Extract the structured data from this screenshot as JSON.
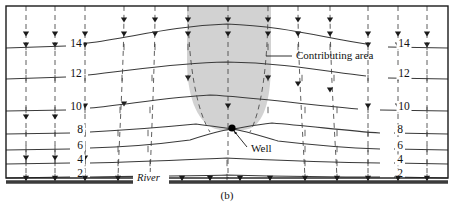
{
  "figure": {
    "caption": "(b)",
    "frame_color": "#1a1a1a",
    "background_color": "#ffffff"
  },
  "annotations": {
    "contributing_area": {
      "label": "Contributing area",
      "fill_color": "#d2d2d2",
      "x": 296,
      "y": 59
    },
    "well": {
      "label": "Well",
      "marker_color": "#000000",
      "x": 251,
      "y": 152,
      "marker_x": 232,
      "marker_y": 128
    },
    "river": {
      "label": "River",
      "x": 137,
      "y": 180
    }
  },
  "chart_data": {
    "type": "contour-map",
    "title": "(b)",
    "contour_variable": "hydraulic head",
    "contour_interval": 2,
    "contour_levels": [
      14,
      12,
      10,
      8,
      6,
      4,
      2
    ],
    "left_labels": [
      {
        "value": "14",
        "x": 76,
        "y": 47
      },
      {
        "value": "12",
        "x": 76,
        "y": 77
      },
      {
        "value": "10",
        "x": 76,
        "y": 110
      },
      {
        "value": "8",
        "x": 80,
        "y": 133
      },
      {
        "value": "6",
        "x": 80,
        "y": 149
      },
      {
        "value": "4",
        "x": 80,
        "y": 163
      },
      {
        "value": "2",
        "x": 80,
        "y": 177
      }
    ],
    "right_labels": [
      {
        "value": "14",
        "x": 404,
        "y": 47
      },
      {
        "value": "12",
        "x": 404,
        "y": 77
      },
      {
        "value": "10",
        "x": 404,
        "y": 110
      },
      {
        "value": "8",
        "x": 400,
        "y": 133
      },
      {
        "value": "6",
        "x": 400,
        "y": 149
      },
      {
        "value": "4",
        "x": 400,
        "y": 163
      },
      {
        "value": "2",
        "x": 400,
        "y": 177
      }
    ],
    "contour_paths": [
      {
        "level": 14,
        "d": "M 6 48 L 66 46 M 88 43 C 130 38 170 26 227 24 C 284 26 324 38 366 44 M 388 47 L 448 48"
      },
      {
        "level": 12,
        "d": "M 6 79 L 66 77 M 88 75 C 130 71 170 63 227 62 C 284 63 324 71 366 76 M 388 78 L 448 79"
      },
      {
        "level": 10,
        "d": "M 6 111 L 66 110 M 90 108 C 130 104 170 97 210 95 C 252 97 300 104 358 109 M 380 110 L 448 111"
      },
      {
        "level": 8,
        "d": "M 6 134 L 70 133 M 90 132 C 130 130 165 127 196 124 C 212 126 224 128 232 129 C 240 128 254 125 272 123 C 310 126 348 131 380 133 M 394 133 L 448 134"
      },
      {
        "level": 6,
        "d": "M 6 150 L 70 149 M 90 148 C 130 147 160 144 190 140 C 208 134 222 130 232 129 C 242 130 258 135 278 141 C 312 145 350 148 380 149 M 394 149 L 448 150"
      },
      {
        "level": 4,
        "d": "M 6 164 L 70 163 M 90 163 C 140 162 180 160 227 158 C 274 160 320 162 380 163 M 394 163 L 448 164"
      },
      {
        "level": 2,
        "d": "M 6 178 L 70 177 M 90 177 C 150 176 190 176 227 175 C 270 176 320 177 380 177 M 394 177 L 448 178"
      }
    ],
    "flowlines": [
      {
        "d": "M 26 6 L 26 178",
        "dashed": true
      },
      {
        "d": "M 55 6 L 55 178",
        "dashed": true
      },
      {
        "d": "M 85 6 L 85 178",
        "dashed": true
      },
      {
        "d": "M 124 6 C 124 60 120 120 118 178",
        "dashed": true
      },
      {
        "d": "M 155 6 C 155 60 152 120 150 178",
        "dashed": true
      },
      {
        "d": "M 188 6 C 188 60 196 110 210 132",
        "dashed": true
      },
      {
        "d": "M 228 6 L 228 178",
        "dashed": true
      },
      {
        "d": "M 268 6 C 268 60 262 110 250 132",
        "dashed": true
      },
      {
        "d": "M 298 6 C 298 60 302 120 305 178",
        "dashed": true
      },
      {
        "d": "M 330 6 C 330 60 334 120 337 178",
        "dashed": true
      },
      {
        "d": "M 368 6 L 368 178",
        "dashed": true
      },
      {
        "d": "M 398 6 L 398 178",
        "dashed": true
      },
      {
        "d": "M 427 6 L 427 178",
        "dashed": true
      }
    ],
    "contributing_area_path": "M 187 6 L 187 60 C 187 95 196 120 213 128 C 222 132 242 132 251 128 C 266 120 271 95 271 60 L 271 6 Z",
    "axis_frame": {
      "x": 6,
      "y": 6,
      "width": 442,
      "height": 172
    },
    "river_boundary_y": 182,
    "grid": false,
    "legend": "none"
  }
}
